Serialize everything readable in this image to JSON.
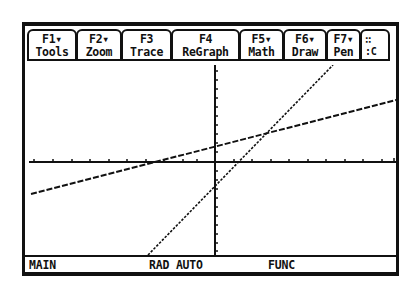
{
  "toolbar": {
    "tabs": [
      {
        "key": "F1▾",
        "label": "Tools"
      },
      {
        "key": "F2▾",
        "label": "Zoom"
      },
      {
        "key": "F3",
        "label": "Trace"
      },
      {
        "key": "F4",
        "label": "ReGraph"
      },
      {
        "key": "F5▾",
        "label": "Math"
      },
      {
        "key": "F6▾",
        "label": "Draw"
      },
      {
        "key": "F7▾",
        "label": "Pen"
      },
      {
        "key": "∷",
        "label": ":C"
      }
    ]
  },
  "graph": {
    "mode": "function",
    "axes": {
      "x_axis_y_px": 97,
      "y_axis_x_px": 190
    },
    "lines": [
      {
        "name": "shallow-line",
        "style": "dotted",
        "x1": 6,
        "y1": 129,
        "x2": 371,
        "y2": 35
      },
      {
        "name": "steep-line",
        "style": "dotted",
        "x1": 123,
        "y1": 190,
        "x2": 308,
        "y2": 0
      }
    ],
    "line_color": "#111111",
    "background": "#ffffff"
  },
  "status_bar": {
    "folder": "MAIN",
    "angle_mode": "RAD AUTO",
    "graph_mode": "FUNC"
  }
}
